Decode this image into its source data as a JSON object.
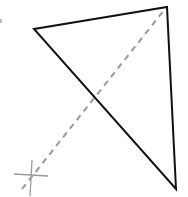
{
  "diagram": {
    "canvas": {
      "width": 188,
      "height": 197,
      "background": "#ffffff"
    },
    "triangle": {
      "vertices": [
        [
          34,
          29
        ],
        [
          167,
          7
        ],
        [
          176,
          189
        ]
      ],
      "stroke": "#111111",
      "stroke_width": 2
    },
    "dashed_line": {
      "from": [
        22,
        189
      ],
      "to": [
        165,
        9
      ],
      "stroke": "#999999",
      "stroke_width": 2,
      "dash": "6,5"
    },
    "crosshair": {
      "center": [
        31,
        175
      ],
      "horizontal": [
        [
          14,
          174
        ],
        [
          48,
          176
        ]
      ],
      "vertical": [
        [
          32,
          160
        ],
        [
          30,
          196
        ]
      ],
      "stroke": "#9a9a9a"
    },
    "edge_mark": {
      "at": [
        1,
        21
      ],
      "color": "#bbbbbb"
    }
  }
}
